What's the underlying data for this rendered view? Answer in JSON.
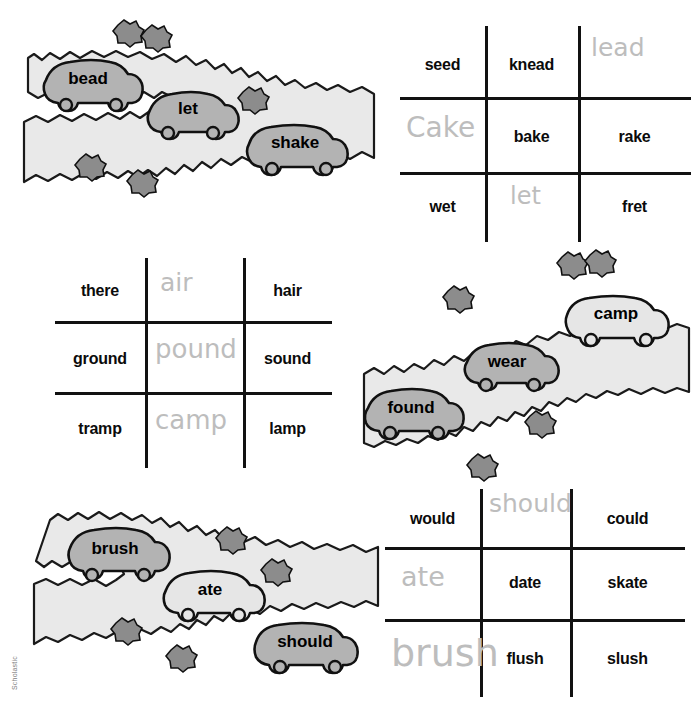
{
  "page": {
    "credit": "Scholastic",
    "background_color": "#ffffff",
    "print_text_color": "#0b0b0b",
    "handwriting_color": "#bdbdbd",
    "grid_line_color": "#111111",
    "road_fill": "#e9e9e9",
    "car_fill_dark": "#b3b3b3",
    "car_fill_light": "#e6e6e6",
    "bush_fill": "#8c8c8c"
  },
  "grids": [
    {
      "id": "grid-top-right",
      "rows": [
        [
          {
            "text": "seed",
            "hand": false
          },
          {
            "text": "knead",
            "hand": false
          },
          {
            "text": "lead",
            "hand": true
          }
        ],
        [
          {
            "text": "Cake",
            "hand": true
          },
          {
            "text": "bake",
            "hand": false
          },
          {
            "text": "rake",
            "hand": false
          }
        ],
        [
          {
            "text": "wet",
            "hand": false
          },
          {
            "text": "let",
            "hand": true
          },
          {
            "text": "fret",
            "hand": false
          }
        ]
      ]
    },
    {
      "id": "grid-middle-left",
      "rows": [
        [
          {
            "text": "there",
            "hand": false
          },
          {
            "text": "air",
            "hand": true
          },
          {
            "text": "hair",
            "hand": false
          }
        ],
        [
          {
            "text": "ground",
            "hand": false
          },
          {
            "text": "pound",
            "hand": true
          },
          {
            "text": "sound",
            "hand": false
          }
        ],
        [
          {
            "text": "tramp",
            "hand": false
          },
          {
            "text": "camp",
            "hand": true
          },
          {
            "text": "lamp",
            "hand": false
          }
        ]
      ]
    },
    {
      "id": "grid-bottom-right",
      "rows": [
        [
          {
            "text": "would",
            "hand": false
          },
          {
            "text": "should",
            "hand": true
          },
          {
            "text": "could",
            "hand": false
          }
        ],
        [
          {
            "text": "ate",
            "hand": true
          },
          {
            "text": "date",
            "hand": false
          },
          {
            "text": "skate",
            "hand": false
          }
        ],
        [
          {
            "text": "brush",
            "hand": true
          },
          {
            "text": "flush",
            "hand": false
          },
          {
            "text": "slush",
            "hand": false
          }
        ]
      ]
    }
  ],
  "scenes": [
    {
      "id": "scene-top-left",
      "cars": [
        {
          "label": "bead",
          "shade": "dark"
        },
        {
          "label": "let",
          "shade": "dark"
        },
        {
          "label": "shake",
          "shade": "dark"
        }
      ]
    },
    {
      "id": "scene-middle-right",
      "cars": [
        {
          "label": "found",
          "shade": "dark"
        },
        {
          "label": "wear",
          "shade": "dark"
        },
        {
          "label": "camp",
          "shade": "light"
        }
      ]
    },
    {
      "id": "scene-bottom-left",
      "cars": [
        {
          "label": "brush",
          "shade": "dark"
        },
        {
          "label": "ate",
          "shade": "light"
        },
        {
          "label": "should",
          "shade": "dark"
        }
      ]
    }
  ]
}
